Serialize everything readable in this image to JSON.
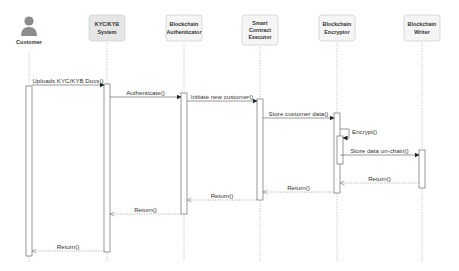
{
  "diagram": {
    "type": "sequence",
    "colors": {
      "box_fill": "#f5f5f5",
      "box_fill_highlight": "#e6e6e6",
      "box_stroke": "#d0d0d0",
      "line": "#555555",
      "lifeline": "#aaaaaa",
      "actor": "#8c8c8c",
      "text": "#333333"
    },
    "participants": [
      {
        "id": "customer",
        "label": "Customer",
        "kind": "actor",
        "lines": [
          "Customer"
        ]
      },
      {
        "id": "kyc",
        "label": "KYC/KYB System",
        "kind": "box",
        "highlight": true,
        "lines": [
          "KYC/KYB",
          "System"
        ]
      },
      {
        "id": "auth",
        "label": "Blockchain Authenticator",
        "kind": "box",
        "lines": [
          "Blockchain",
          "Authenticator"
        ]
      },
      {
        "id": "sce",
        "label": "Smart Contract Executor",
        "kind": "box",
        "lines": [
          "Smart",
          "Contract",
          "Executor"
        ]
      },
      {
        "id": "enc",
        "label": "Blockchain Encryptor",
        "kind": "box",
        "lines": [
          "Blockchain",
          "Encryptor"
        ]
      },
      {
        "id": "writer",
        "label": "Blockchain Writer",
        "kind": "box",
        "lines": [
          "Blockchain",
          "Writer"
        ]
      }
    ],
    "messages": [
      {
        "from": "customer",
        "to": "kyc",
        "label": "Uploads KYC/KYB Docs()",
        "kind": "call"
      },
      {
        "from": "kyc",
        "to": "auth",
        "label": "Authenticate()",
        "kind": "call"
      },
      {
        "from": "auth",
        "to": "sce",
        "label": "Initiate new customer()",
        "kind": "call"
      },
      {
        "from": "sce",
        "to": "enc",
        "label": "Store customer data()",
        "kind": "call"
      },
      {
        "from": "enc",
        "to": "enc",
        "label": "Encrypt()",
        "kind": "self"
      },
      {
        "from": "enc",
        "to": "writer",
        "label": "Store data on-chain()",
        "kind": "call"
      },
      {
        "from": "writer",
        "to": "enc",
        "label": "Return()",
        "kind": "return"
      },
      {
        "from": "enc",
        "to": "sce",
        "label": "Return()",
        "kind": "return"
      },
      {
        "from": "sce",
        "to": "auth",
        "label": "Return()",
        "kind": "return"
      },
      {
        "from": "auth",
        "to": "kyc",
        "label": "Return()",
        "kind": "return"
      },
      {
        "from": "kyc",
        "to": "customer",
        "label": "Return()",
        "kind": "return"
      }
    ]
  }
}
